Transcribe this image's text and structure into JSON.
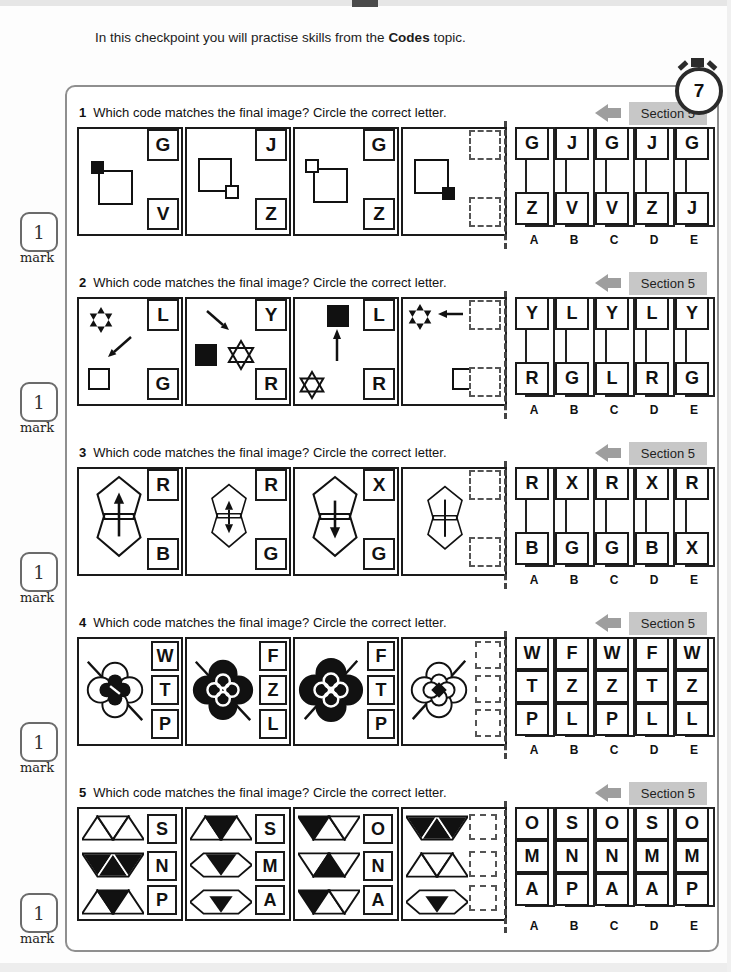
{
  "page": {
    "intro_prefix": "In this checkpoint you will practise skills from the ",
    "intro_bold": "Codes",
    "intro_suffix": " topic.",
    "timer_value": "7"
  },
  "mark": {
    "value": "1",
    "label": "mark"
  },
  "section_badge": "Section 5",
  "question_text": "Which code matches the final image? Circle the correct letter.",
  "option_labels": [
    "A",
    "B",
    "C",
    "D",
    "E"
  ],
  "questions": [
    {
      "number": "1",
      "images": [
        [
          "G",
          "V"
        ],
        [
          "J",
          "Z"
        ],
        [
          "G",
          "Z"
        ]
      ],
      "answers": [
        [
          "G",
          "Z"
        ],
        [
          "J",
          "V"
        ],
        [
          "G",
          "V"
        ],
        [
          "J",
          "Z"
        ],
        [
          "G",
          "J"
        ]
      ]
    },
    {
      "number": "2",
      "images": [
        [
          "L",
          "G"
        ],
        [
          "Y",
          "R"
        ],
        [
          "L",
          "R"
        ]
      ],
      "answers": [
        [
          "Y",
          "R"
        ],
        [
          "L",
          "G"
        ],
        [
          "Y",
          "L"
        ],
        [
          "L",
          "R"
        ],
        [
          "Y",
          "G"
        ]
      ]
    },
    {
      "number": "3",
      "images": [
        [
          "R",
          "B"
        ],
        [
          "R",
          "G"
        ],
        [
          "X",
          "G"
        ]
      ],
      "answers": [
        [
          "R",
          "B"
        ],
        [
          "X",
          "G"
        ],
        [
          "R",
          "G"
        ],
        [
          "X",
          "B"
        ],
        [
          "R",
          "X"
        ]
      ]
    },
    {
      "number": "4",
      "images": [
        [
          "W",
          "T",
          "P"
        ],
        [
          "F",
          "Z",
          "L"
        ],
        [
          "F",
          "T",
          "P"
        ]
      ],
      "answers": [
        [
          "W",
          "T",
          "P"
        ],
        [
          "F",
          "Z",
          "L"
        ],
        [
          "W",
          "Z",
          "P"
        ],
        [
          "F",
          "T",
          "L"
        ],
        [
          "W",
          "Z",
          "L"
        ]
      ]
    },
    {
      "number": "5",
      "images": [
        [
          "S",
          "N",
          "P"
        ],
        [
          "S",
          "M",
          "A"
        ],
        [
          "O",
          "N",
          "A"
        ]
      ],
      "answers": [
        [
          "O",
          "M",
          "A"
        ],
        [
          "S",
          "N",
          "P"
        ],
        [
          "O",
          "N",
          "A"
        ],
        [
          "S",
          "M",
          "A"
        ],
        [
          "O",
          "M",
          "P"
        ]
      ]
    }
  ]
}
